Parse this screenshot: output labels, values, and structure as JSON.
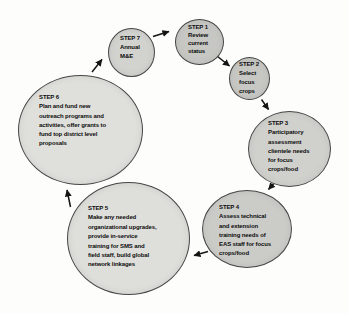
{
  "diagram": {
    "name": "extension-program-cycle",
    "background": "#fdfdfb",
    "circle_border_color": "#454545",
    "arrow_color": "#141414",
    "steps": [
      {
        "label": "STEP 1",
        "text": "Review\ncurrent\nstatus",
        "fill": "#c7c7c4"
      },
      {
        "label": "STEP 2",
        "text": "Select\nfocus\ncrops",
        "fill": "#c7c7c4"
      },
      {
        "label": "STEP 3",
        "text": "Participatory\nassessment\nclientele needs\nfor focus\ncrops/food",
        "fill": "#d0d0cd"
      },
      {
        "label": "STEP 4",
        "text": "Assess technical\nand extension\ntraining needs of\nEAS staff for focus\ncrops/food",
        "fill": "#cbcbc8"
      },
      {
        "label": "STEP 5",
        "text": "Make any needed\norganizational upgrades,\nprovide in-service\ntraining for SMS and\nfield staff, build global\nnetwork linkages",
        "fill": "#dededa"
      },
      {
        "label": "STEP 6",
        "text": "Plan and fund new\noutreach programs and\nactivities, offer grants to\nfund top district level\nproposals",
        "fill": "#dfdfdb"
      },
      {
        "label": "STEP 7",
        "text": "Annual\nM&E",
        "fill": "#d2d2cf"
      }
    ]
  }
}
